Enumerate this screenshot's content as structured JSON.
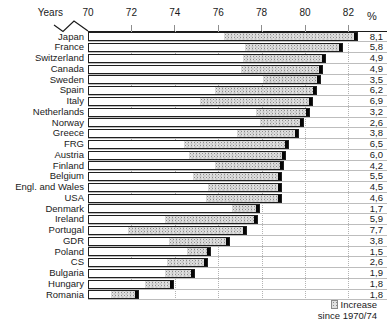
{
  "header": {
    "axis_label": "Years",
    "percent_symbol": "%"
  },
  "legend": {
    "line1": "Increase",
    "line2": "since 1970/74"
  },
  "chart_data": {
    "type": "bar",
    "orientation": "horizontal",
    "title": "",
    "xlabel": "Years",
    "x_ticks": [
      70,
      72,
      74,
      76,
      78,
      80,
      82
    ],
    "x_range": [
      70,
      83.8
    ],
    "axis_break_before_70": true,
    "grid": "dotted vertical gridlines at even years",
    "right_column_header": "%",
    "legend_position": "bottom-right",
    "legend_meaning": "stippled segment = increase since 1970/74",
    "bar_segments": [
      "base value 1970/74 (white)",
      "increase since 1970/74 (stippled)",
      "black end cap at current value"
    ],
    "rows": [
      {
        "country": "Japan",
        "base": 76.2,
        "current": 82.4,
        "increase_pct": "8,1"
      },
      {
        "country": "France",
        "base": 77.2,
        "current": 81.7,
        "increase_pct": "5,8"
      },
      {
        "country": "Switzerland",
        "base": 77.1,
        "current": 80.9,
        "increase_pct": "4,9"
      },
      {
        "country": "Canada",
        "base": 77.0,
        "current": 80.8,
        "increase_pct": "4,9"
      },
      {
        "country": "Sweden",
        "base": 78.0,
        "current": 80.7,
        "increase_pct": "3,5"
      },
      {
        "country": "Spain",
        "base": 75.8,
        "current": 80.5,
        "increase_pct": "6,2"
      },
      {
        "country": "Italy",
        "base": 75.1,
        "current": 80.3,
        "increase_pct": "6,9"
      },
      {
        "country": "Netherlands",
        "base": 77.7,
        "current": 80.2,
        "increase_pct": "3,2"
      },
      {
        "country": "Norway",
        "base": 77.9,
        "current": 79.9,
        "increase_pct": "2,6"
      },
      {
        "country": "Greece",
        "base": 76.8,
        "current": 79.7,
        "increase_pct": "3,8"
      },
      {
        "country": "FRG",
        "base": 74.4,
        "current": 79.2,
        "increase_pct": "6,5"
      },
      {
        "country": "Austria",
        "base": 74.6,
        "current": 79.1,
        "increase_pct": "6,0"
      },
      {
        "country": "Finland",
        "base": 75.8,
        "current": 79.0,
        "increase_pct": "4,2"
      },
      {
        "country": "Belgium",
        "base": 74.8,
        "current": 78.9,
        "increase_pct": "5,5"
      },
      {
        "country": "Engl. and Wales",
        "base": 75.5,
        "current": 78.9,
        "increase_pct": "4,5"
      },
      {
        "country": "USA",
        "base": 75.4,
        "current": 78.9,
        "increase_pct": "4,6"
      },
      {
        "country": "Denmark",
        "base": 76.6,
        "current": 77.9,
        "increase_pct": "1,7"
      },
      {
        "country": "Ireland",
        "base": 73.5,
        "current": 77.8,
        "increase_pct": "5,9"
      },
      {
        "country": "Portugal",
        "base": 71.8,
        "current": 77.3,
        "increase_pct": "7,7"
      },
      {
        "country": "GDR",
        "base": 73.7,
        "current": 76.5,
        "increase_pct": "3,8"
      },
      {
        "country": "Poland",
        "base": 74.5,
        "current": 75.6,
        "increase_pct": "1,5"
      },
      {
        "country": "CS",
        "base": 73.6,
        "current": 75.5,
        "increase_pct": "2,6"
      },
      {
        "country": "Bulgaria",
        "base": 73.5,
        "current": 74.9,
        "increase_pct": "1,9"
      },
      {
        "country": "Hungary",
        "base": 72.6,
        "current": 73.9,
        "increase_pct": "1,8"
      },
      {
        "country": "Romania",
        "base": 71.0,
        "current": 72.3,
        "increase_pct": "1,8"
      }
    ]
  }
}
